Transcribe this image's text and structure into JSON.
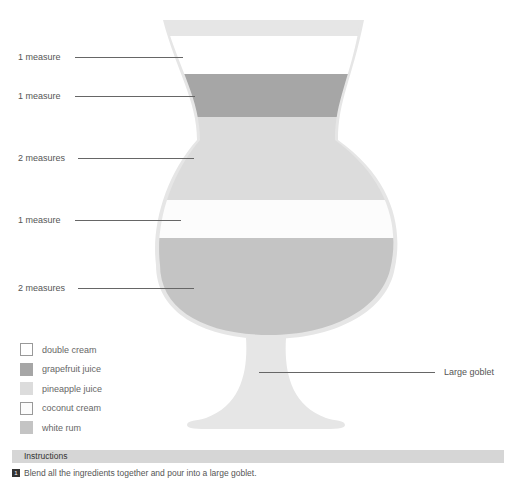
{
  "diagram": {
    "layers": [
      {
        "label": "1 measure",
        "ingredient": "double cream",
        "color": "#ffffff"
      },
      {
        "label": "1 measure",
        "ingredient": "grapefruit juice",
        "color": "#a6a6a6"
      },
      {
        "label": "2 measures",
        "ingredient": "pineapple juice",
        "color": "#dcdcdc"
      },
      {
        "label": "1 measure",
        "ingredient": "coconut cream",
        "color": "#fcfcfc"
      },
      {
        "label": "2 measures",
        "ingredient": "white rum",
        "color": "#c4c4c4"
      }
    ],
    "glass_label": "Large goblet",
    "glass_color": "#e6e6e6"
  },
  "legend": [
    {
      "label": "double cream",
      "color": "#ffffff",
      "border": "#999999"
    },
    {
      "label": "grapefruit juice",
      "color": "#a6a6a6",
      "border": "#a6a6a6"
    },
    {
      "label": "pineapple juice",
      "color": "#dcdcdc",
      "border": "#dcdcdc"
    },
    {
      "label": "coconut cream",
      "color": "#fcfcfc",
      "border": "#999999"
    },
    {
      "label": "white rum",
      "color": "#c4c4c4",
      "border": "#c4c4c4"
    }
  ],
  "instructions": {
    "title": "Instructions",
    "steps": [
      {
        "number": "1",
        "text": "Blend all the ingredients together and pour into a large goblet."
      }
    ]
  }
}
